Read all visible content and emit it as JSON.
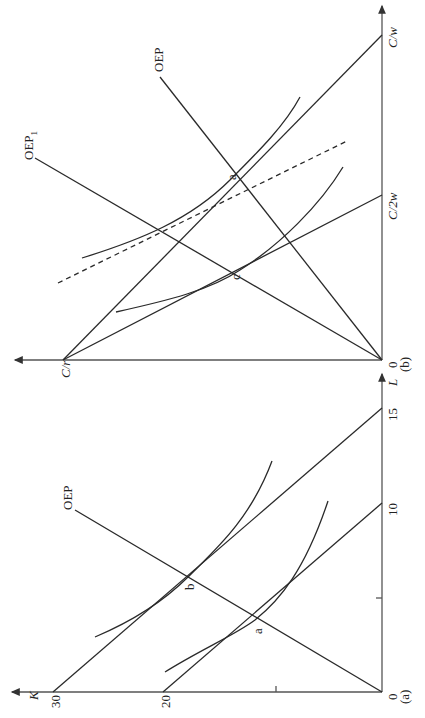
{
  "figure": {
    "orientation": "rotated 90 degrees counter-clockwise",
    "panel_a": {
      "tag": "(a)",
      "origin_label": "0",
      "y_axis_label": "K",
      "x_axis_label": "L",
      "k_ticks": [
        "20",
        "30"
      ],
      "l_ticks": [
        "10",
        "15"
      ],
      "expansion_path_label": "OEP",
      "points": [
        "a",
        "b"
      ]
    },
    "panel_b": {
      "tag": "(b)",
      "origin_label": "0",
      "k_intercept_label": "C/r",
      "l_intercept_labels": [
        "C/2w",
        "C/w"
      ],
      "expansion_path_label": "OEP",
      "expansion_path_1_label": "OEP",
      "expansion_path_1_sub": "1",
      "points": [
        "a",
        "c"
      ]
    }
  }
}
